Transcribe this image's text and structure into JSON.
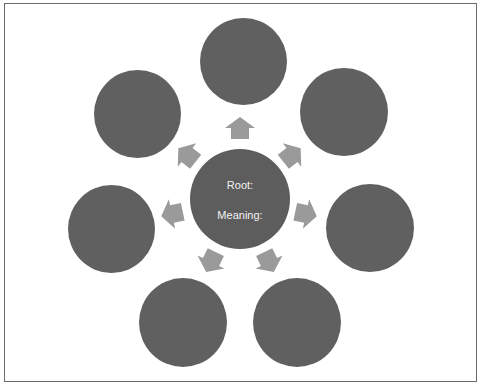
{
  "diagram": {
    "type": "radial",
    "center": {
      "root_label": "Root:",
      "meaning_label": "Meaning:"
    },
    "colors": {
      "node_fill": "#606060",
      "arrow_fill": "#9a9a9a",
      "text_color": "#f2f2f2",
      "frame_border": "#6a6a6a"
    },
    "outer_nodes": [
      {
        "position": "top",
        "label": ""
      },
      {
        "position": "top-right",
        "label": ""
      },
      {
        "position": "right",
        "label": ""
      },
      {
        "position": "bottom-right",
        "label": ""
      },
      {
        "position": "bottom-left",
        "label": ""
      },
      {
        "position": "left",
        "label": ""
      },
      {
        "position": "top-left",
        "label": ""
      }
    ],
    "arrow_count": 7
  }
}
